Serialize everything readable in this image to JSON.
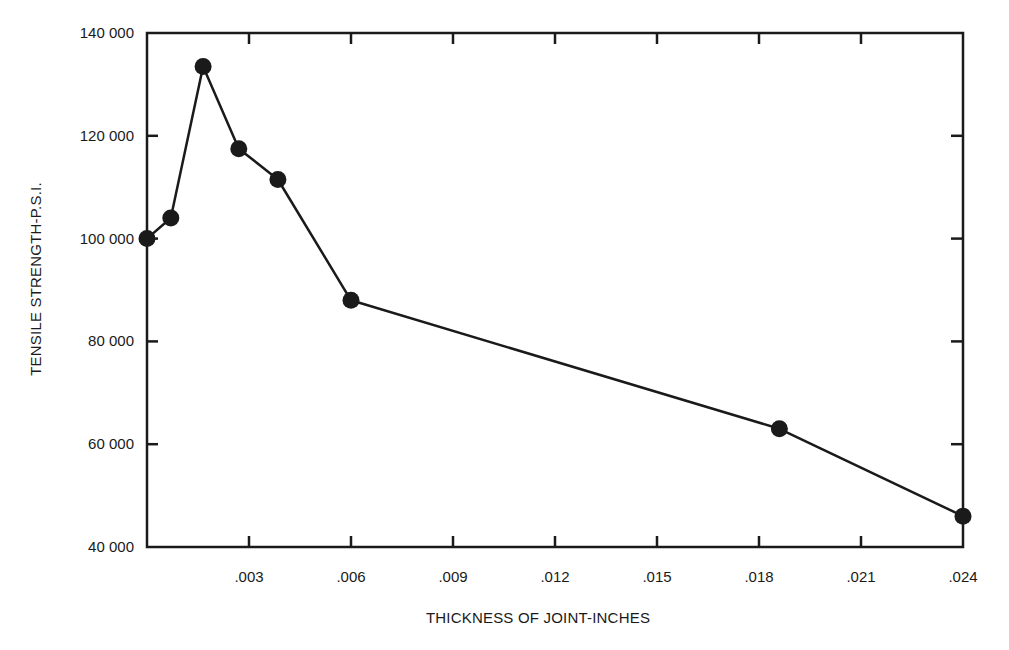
{
  "chart_data": {
    "type": "line",
    "title": "",
    "xlabel": "THICKNESS OF JOINT-INCHES",
    "ylabel": "TENSILE STRENGTH-P.S.I.",
    "xlim": [
      0,
      0.024
    ],
    "ylim": [
      40000,
      140000
    ],
    "grid": false,
    "legend": null,
    "x_ticks": [
      0.003,
      0.006,
      0.009,
      0.012,
      0.015,
      0.018,
      0.021,
      0.024
    ],
    "x_tick_labels": [
      ".003",
      ".006",
      ".009",
      ".012",
      ".015",
      ".018",
      ".021",
      ".024"
    ],
    "y_ticks": [
      40000,
      60000,
      80000,
      100000,
      120000,
      140000
    ],
    "y_tick_labels": [
      "40 000",
      "60 000",
      "80 000",
      "100 000",
      "120 000",
      "140 000"
    ],
    "series": [
      {
        "name": "Tensile strength",
        "marker": "filled-circle",
        "color": "#1a1a1a",
        "x": [
          0.0,
          0.0007,
          0.00165,
          0.0027,
          0.00385,
          0.006,
          0.0186,
          0.024
        ],
        "values": [
          100000,
          104000,
          133500,
          117500,
          111500,
          88000,
          63000,
          46000
        ]
      }
    ]
  },
  "labels": {
    "x_axis_title": "THICKNESS OF JOINT-INCHES",
    "y_axis_title": "TENSILE STRENGTH-P.S.I."
  },
  "colors": {
    "ink": "#1a1a1a",
    "background": "#ffffff"
  }
}
